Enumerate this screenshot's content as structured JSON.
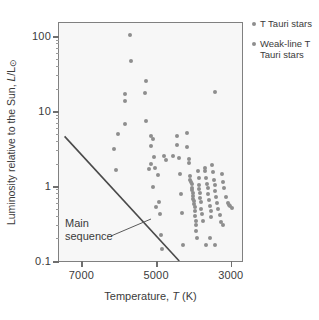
{
  "chart_data": {
    "type": "scatter",
    "title": "",
    "xlabel": "Temperature, T (K)",
    "ylabel": "Luminosity relative to the Sun, L/L⊙",
    "xscale": "linear-reversed",
    "yscale": "log",
    "xlim": [
      7600,
      2700
    ],
    "ylim": [
      0.1,
      150
    ],
    "xticks": [
      7000,
      5000,
      3000
    ],
    "xtick_labels": [
      "7000",
      "5000",
      "3000"
    ],
    "yticks": [
      0.1,
      1,
      10,
      100
    ],
    "ytick_labels": [
      "0.1",
      "1",
      "10",
      "100"
    ],
    "grid": false,
    "marker_color": "#8e8e8e",
    "frame_color": "#808080",
    "plot_background": "#f7f7f7",
    "annotations": [
      {
        "text_line1": "Main",
        "text_line2": "sequence",
        "name": "main-sequence-label"
      }
    ],
    "main_sequence_line": {
      "label": "Main sequence",
      "x": [
        7450,
        4380
      ],
      "y": [
        4.6,
        0.1
      ]
    },
    "series": [
      {
        "name": "T Tauri stars",
        "color": "#8e8e8e",
        "points": [
          [
            5700,
            105
          ],
          [
            5680,
            46
          ],
          [
            5260,
            25
          ],
          [
            5310,
            17.5
          ],
          [
            5840,
            17.0
          ],
          [
            5830,
            13.5
          ],
          [
            5840,
            6.8
          ],
          [
            5260,
            7.3
          ],
          [
            6010,
            5.0
          ],
          [
            5130,
            4.6
          ],
          [
            5080,
            4.3
          ],
          [
            3420,
            18.0
          ],
          [
            6130,
            3.1
          ],
          [
            5150,
            3.4
          ],
          [
            5050,
            2.45
          ],
          [
            4780,
            2.55
          ],
          [
            4740,
            2.25
          ],
          [
            4560,
            2.55
          ],
          [
            5130,
            1.95
          ],
          [
            5020,
            1.75
          ],
          [
            5200,
            1.7
          ],
          [
            6070,
            1.62
          ],
          [
            4940,
            1.42
          ],
          [
            5080,
            0.98
          ],
          [
            4920,
            0.62
          ],
          [
            5000,
            0.52
          ],
          [
            4890,
            0.42
          ],
          [
            4860,
            0.225
          ],
          [
            4840,
            0.145
          ],
          [
            4450,
            4.7
          ],
          [
            4430,
            3.55
          ],
          [
            4400,
            2.35
          ],
          [
            4350,
            1.45
          ],
          [
            4330,
            0.78
          ],
          [
            4300,
            0.44
          ],
          [
            4290,
            0.165
          ],
          [
            4180,
            5.1
          ],
          [
            4160,
            3.35
          ],
          [
            4130,
            2.3
          ],
          [
            4120,
            2.05
          ],
          [
            4100,
            1.35
          ],
          [
            4080,
            1.22
          ],
          [
            4060,
            1.15
          ],
          [
            4050,
            1.05
          ],
          [
            4040,
            0.95
          ],
          [
            4030,
            0.88
          ],
          [
            4020,
            0.8
          ],
          [
            4010,
            0.73
          ],
          [
            4000,
            0.68
          ],
          [
            3990,
            0.63
          ],
          [
            3980,
            0.58
          ],
          [
            3970,
            0.52
          ],
          [
            3960,
            0.46
          ],
          [
            3950,
            0.4
          ],
          [
            3940,
            0.345
          ],
          [
            3930,
            0.3
          ],
          [
            3920,
            0.255
          ],
          [
            3905,
            0.205
          ],
          [
            3880,
            1.6
          ],
          [
            3860,
            1.28
          ],
          [
            3850,
            1.02
          ],
          [
            3840,
            0.9
          ],
          [
            3830,
            0.8
          ],
          [
            3820,
            0.7
          ],
          [
            3810,
            0.62
          ],
          [
            3790,
            0.5
          ],
          [
            3770,
            0.42
          ],
          [
            3750,
            0.34
          ],
          [
            3700,
            1.72
          ],
          [
            3680,
            1.58
          ],
          [
            3660,
            1.3
          ],
          [
            3640,
            1.08
          ],
          [
            3620,
            0.95
          ],
          [
            3600,
            0.78
          ],
          [
            3580,
            0.66
          ],
          [
            3560,
            0.55
          ],
          [
            3540,
            0.46
          ],
          [
            3520,
            0.39
          ],
          [
            3500,
            1.9
          ],
          [
            3470,
            1.55
          ],
          [
            3450,
            1.2
          ],
          [
            3430,
            1.02
          ],
          [
            3410,
            0.86
          ],
          [
            3390,
            0.72
          ],
          [
            3360,
            0.6
          ],
          [
            3330,
            0.5
          ],
          [
            3300,
            0.41
          ],
          [
            3270,
            0.335
          ],
          [
            3230,
            1.45
          ],
          [
            3200,
            1.15
          ],
          [
            3170,
            0.95
          ],
          [
            3120,
            0.72
          ],
          [
            3080,
            0.59
          ],
          [
            3050,
            0.56
          ],
          [
            3010,
            0.54
          ],
          [
            2960,
            0.51
          ],
          [
            3660,
            0.165
          ],
          [
            3430,
            0.165
          ],
          [
            3210,
            0.305
          ],
          [
            3560,
            0.205
          ]
        ]
      },
      {
        "name": "Weak-line T Tauri stars",
        "color": "#8e8e8e",
        "points": []
      }
    ]
  },
  "legend": {
    "position": "top-right",
    "items": [
      {
        "label": "T Tauri stars",
        "color": "#8e8e8e",
        "name": "legend-t-tauri"
      },
      {
        "label": "Weak-line T Tauri stars",
        "color": "#8e8e8e",
        "name": "legend-weak-line-t-tauri"
      }
    ]
  },
  "axis": {
    "y_title_prefix": "Luminosity relative to the Sun, ",
    "y_title_symbol_italic": "L",
    "y_title_symbol_rest": "/L",
    "y_title_sun": "⊙",
    "x_title_prefix": "Temperature, ",
    "x_title_symbol_italic": "T",
    "x_title_suffix": " (K)"
  }
}
